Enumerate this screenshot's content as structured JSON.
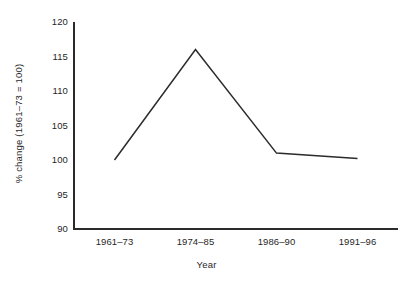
{
  "chart_data": {
    "type": "line",
    "title": "",
    "subtitle": "",
    "xlabel": "Year",
    "ylabel": "% change (1961–73 = 100)",
    "categories": [
      "1961–73",
      "1974–85",
      "1986–90",
      "1991–96"
    ],
    "values": [
      100,
      116,
      101,
      100.2
    ],
    "series": [
      {
        "name": "% change index",
        "values": [
          100,
          116,
          101,
          100.2
        ]
      }
    ],
    "ylim": [
      90,
      120
    ],
    "yticks": [
      90,
      95,
      100,
      105,
      110,
      115,
      120
    ],
    "ytick_labels": [
      "90",
      "95",
      "100",
      "105",
      "110",
      "115",
      "120"
    ],
    "grid": false,
    "legend": false,
    "legend_position": "none",
    "line_color": "#2b2b2b",
    "axis_color": "#2b2b2b",
    "background_color": "#ffffff",
    "markers": false
  },
  "axes": {
    "x_title": "Year",
    "y_title": "% change (1961–73 = 100)"
  }
}
